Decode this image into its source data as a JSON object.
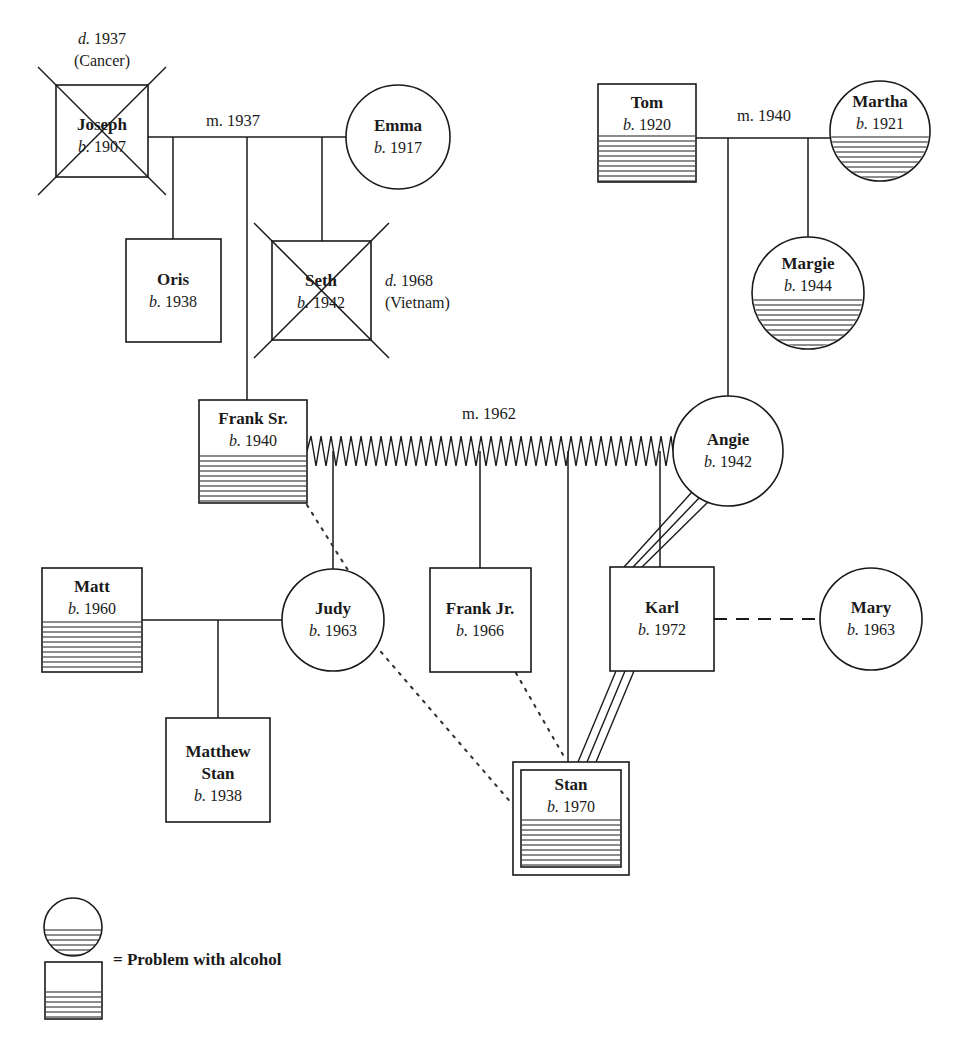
{
  "diagram": {
    "kind": "genogram",
    "title": "",
    "legend": {
      "label": "= Problem with alcohol",
      "circle_marker": "half-hatched-circle",
      "square_marker": "half-hatched-square"
    },
    "symbols": {
      "male": "square",
      "female": "circle",
      "deceased": "x-through-shape",
      "index_person": "double-outline-square",
      "alcohol": "lower-half-horizontal-hatching",
      "marriage": "solid-horizontal-line",
      "conflictual": "zigzag-line",
      "fused_enmeshed": "triple-parallel-line",
      "distant": "dotted-line",
      "cohabiting": "dashed-line"
    },
    "people": [
      {
        "id": "joseph",
        "name": "Joseph",
        "birth": "b. 1907",
        "shape": "square",
        "sex": "male",
        "deceased": true,
        "death_note_line1": "d. 1937",
        "death_note_line2": "(Cancer)",
        "alcohol": false,
        "index": false,
        "x": 56,
        "y": 85,
        "w": 92,
        "h": 92
      },
      {
        "id": "emma",
        "name": "Emma",
        "birth": "b. 1917",
        "shape": "circle",
        "sex": "female",
        "deceased": false,
        "death_note_line1": "",
        "death_note_line2": "",
        "alcohol": false,
        "index": false,
        "cx": 398,
        "cy": 137,
        "r": 52
      },
      {
        "id": "oris",
        "name": "Oris",
        "birth": "b. 1938",
        "shape": "square",
        "sex": "male",
        "deceased": false,
        "death_note_line1": "",
        "death_note_line2": "",
        "alcohol": false,
        "index": false,
        "x": 126,
        "y": 239,
        "w": 95,
        "h": 103
      },
      {
        "id": "seth",
        "name": "Seth",
        "birth": "b. 1942",
        "shape": "square",
        "sex": "male",
        "deceased": true,
        "death_note_line1": "d. 1968",
        "death_note_line2": "(Vietnam)",
        "alcohol": false,
        "index": false,
        "x": 272,
        "y": 241,
        "w": 99,
        "h": 99
      },
      {
        "id": "tom",
        "name": "Tom",
        "birth": "b. 1920",
        "shape": "square",
        "sex": "male",
        "deceased": false,
        "death_note_line1": "",
        "death_note_line2": "",
        "alcohol": true,
        "index": false,
        "x": 598,
        "y": 84,
        "w": 98,
        "h": 98
      },
      {
        "id": "martha",
        "name": "Martha",
        "birth": "b. 1921",
        "shape": "circle",
        "sex": "female",
        "deceased": false,
        "death_note_line1": "",
        "death_note_line2": "",
        "alcohol": true,
        "index": false,
        "cx": 880,
        "cy": 131,
        "r": 50
      },
      {
        "id": "margie",
        "name": "Margie",
        "birth": "b. 1944",
        "shape": "circle",
        "sex": "female",
        "deceased": false,
        "death_note_line1": "",
        "death_note_line2": "",
        "alcohol": true,
        "index": false,
        "cx": 808,
        "cy": 293,
        "r": 56
      },
      {
        "id": "franksr",
        "name": "Frank Sr.",
        "birth": "b. 1940",
        "shape": "square",
        "sex": "male",
        "deceased": false,
        "death_note_line1": "",
        "death_note_line2": "",
        "alcohol": true,
        "index": false,
        "x": 199,
        "y": 400,
        "w": 108,
        "h": 103
      },
      {
        "id": "angie",
        "name": "Angie",
        "birth": "b. 1942",
        "shape": "circle",
        "sex": "female",
        "deceased": false,
        "death_note_line1": "",
        "death_note_line2": "",
        "alcohol": false,
        "index": false,
        "cx": 728,
        "cy": 451,
        "r": 55
      },
      {
        "id": "matt",
        "name": "Matt",
        "birth": "b. 1960",
        "shape": "square",
        "sex": "male",
        "deceased": false,
        "death_note_line1": "",
        "death_note_line2": "",
        "alcohol": true,
        "index": false,
        "x": 42,
        "y": 568,
        "w": 100,
        "h": 104
      },
      {
        "id": "judy",
        "name": "Judy",
        "birth": "b. 1963",
        "shape": "circle",
        "sex": "female",
        "deceased": false,
        "death_note_line1": "",
        "death_note_line2": "",
        "alcohol": false,
        "index": false,
        "cx": 333,
        "cy": 620,
        "r": 51
      },
      {
        "id": "matthew",
        "name": "Matthew Stan",
        "birth": "b. 1938",
        "shape": "square",
        "sex": "male",
        "deceased": false,
        "death_note_line1": "",
        "death_note_line2": "",
        "alcohol": false,
        "index": false,
        "x": 166,
        "y": 718,
        "w": 104,
        "h": 104
      },
      {
        "id": "frankjr",
        "name": "Frank Jr.",
        "birth": "b. 1966",
        "shape": "square",
        "sex": "male",
        "deceased": false,
        "death_note_line1": "",
        "death_note_line2": "",
        "alcohol": false,
        "index": false,
        "x": 430,
        "y": 568,
        "w": 101,
        "h": 104
      },
      {
        "id": "karl",
        "name": "Karl",
        "birth": "b. 1972",
        "shape": "square",
        "sex": "male",
        "deceased": false,
        "death_note_line1": "",
        "death_note_line2": "",
        "alcohol": false,
        "index": false,
        "x": 610,
        "y": 567,
        "w": 104,
        "h": 104
      },
      {
        "id": "mary",
        "name": "Mary",
        "birth": "b. 1963",
        "shape": "circle",
        "sex": "female",
        "deceased": false,
        "death_note_line1": "",
        "death_note_line2": "",
        "alcohol": false,
        "index": false,
        "cx": 871,
        "cy": 619,
        "r": 51
      },
      {
        "id": "stan",
        "name": "Stan",
        "birth": "b. 1970",
        "shape": "square",
        "sex": "male",
        "deceased": false,
        "death_note_line1": "",
        "death_note_line2": "",
        "alcohol": true,
        "index": true,
        "x": 513,
        "y": 762,
        "w": 116,
        "h": 113
      }
    ],
    "marriages": [
      {
        "id": "joseph-emma",
        "label": "m. 1937",
        "type": "marriage",
        "label_x": 233,
        "label_y": 131
      },
      {
        "id": "tom-martha",
        "label": "m. 1940",
        "type": "marriage",
        "label_x": 764,
        "label_y": 126
      },
      {
        "id": "franksr-angie",
        "label": "m. 1962",
        "type": "conflictual",
        "label_x": 489,
        "label_y": 424
      },
      {
        "id": "matt-judy",
        "label": "",
        "type": "marriage",
        "label_x": 0,
        "label_y": 0
      }
    ],
    "relationships": [
      {
        "from": "franksr",
        "to": "judy",
        "type": "distant"
      },
      {
        "from": "judy",
        "to": "stan",
        "type": "distant"
      },
      {
        "from": "frankjr",
        "to": "stan",
        "type": "distant"
      },
      {
        "from": "angie",
        "to": "karl",
        "type": "fused_enmeshed"
      },
      {
        "from": "karl",
        "to": "stan",
        "type": "fused_enmeshed"
      },
      {
        "from": "karl",
        "to": "mary",
        "type": "cohabiting"
      }
    ],
    "children": [
      {
        "parents": "joseph-emma",
        "child": "oris"
      },
      {
        "parents": "joseph-emma",
        "child": "franksr"
      },
      {
        "parents": "joseph-emma",
        "child": "seth"
      },
      {
        "parents": "tom-martha",
        "child": "margie"
      },
      {
        "parents": "tom-martha",
        "child": "angie"
      },
      {
        "parents": "franksr-angie",
        "child": "judy"
      },
      {
        "parents": "franksr-angie",
        "child": "frankjr"
      },
      {
        "parents": "franksr-angie",
        "child": "stan"
      },
      {
        "parents": "franksr-angie",
        "child": "karl"
      },
      {
        "parents": "matt-judy",
        "child": "matthew"
      }
    ]
  }
}
